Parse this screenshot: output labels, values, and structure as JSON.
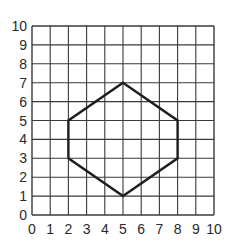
{
  "diagram": {
    "type": "coordinate-grid",
    "grid": {
      "x_min": 0,
      "x_max": 10,
      "y_min": 0,
      "y_max": 10,
      "step": 1,
      "line_color": "#3a3a3a"
    },
    "x_axis": {
      "tick_labels": [
        "0",
        "1",
        "2",
        "3",
        "4",
        "5",
        "6",
        "7",
        "8",
        "9",
        "10"
      ]
    },
    "y_axis": {
      "tick_labels": [
        "0",
        "1",
        "2",
        "3",
        "4",
        "5",
        "6",
        "7",
        "8",
        "9",
        "10"
      ]
    },
    "shape": {
      "name": "hexagon",
      "stroke_color": "#1e1e1e",
      "vertices": [
        {
          "x": 5,
          "y": 7
        },
        {
          "x": 8,
          "y": 5
        },
        {
          "x": 8,
          "y": 3
        },
        {
          "x": 5,
          "y": 1
        },
        {
          "x": 2,
          "y": 3
        },
        {
          "x": 2,
          "y": 5
        }
      ]
    }
  }
}
